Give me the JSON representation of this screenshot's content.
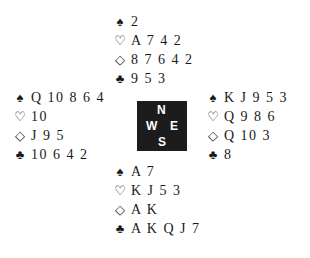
{
  "suits": {
    "spades": "♠",
    "hearts": "♡",
    "diamonds": "◇",
    "clubs": "♣"
  },
  "north": {
    "spades": "2",
    "hearts": "A 7 4 2",
    "diamonds": "8 7 6 4 2",
    "clubs": "9 5 3"
  },
  "west": {
    "spades": "Q 10 8 6 4",
    "hearts": "10",
    "diamonds": "J 9 5",
    "clubs": "10 6 4 2"
  },
  "east": {
    "spades": "K J 9 5 3",
    "hearts": "Q 9 8 6",
    "diamonds": "Q 10 3",
    "clubs": "8"
  },
  "south": {
    "spades": "A 7",
    "hearts": "K J 5 3",
    "diamonds": "A K",
    "clubs": "A K Q J 7"
  },
  "compass": {
    "n": "N",
    "s": "S",
    "w": "W",
    "e": "E"
  }
}
